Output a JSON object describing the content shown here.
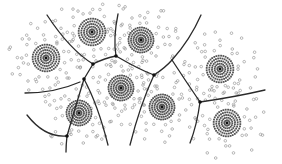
{
  "diagram": {
    "type": "voronoi-cluster-tessellation",
    "width": 282,
    "height": 164,
    "colors": {
      "background": "#ffffff",
      "boundary": "#2a2a2a",
      "junction": "#111111",
      "core_dot": "#555555",
      "scatter_dot": "#9a9a9a",
      "center": "#111111"
    },
    "clusters": [
      {
        "id": "c1",
        "cx": 46,
        "cy": 58,
        "r": 15
      },
      {
        "id": "c2",
        "cx": 92,
        "cy": 32,
        "r": 15
      },
      {
        "id": "c3",
        "cx": 141,
        "cy": 40,
        "r": 14
      },
      {
        "id": "c4",
        "cx": 220,
        "cy": 69,
        "r": 15
      },
      {
        "id": "c5",
        "cx": 121,
        "cy": 88,
        "r": 14
      },
      {
        "id": "c6",
        "cx": 79,
        "cy": 113,
        "r": 14
      },
      {
        "id": "c7",
        "cx": 162,
        "cy": 107,
        "r": 14
      },
      {
        "id": "c8",
        "cx": 227,
        "cy": 123,
        "r": 15
      }
    ],
    "junctions": [
      {
        "x": 93,
        "y": 64
      },
      {
        "x": 116,
        "y": 56
      },
      {
        "x": 84,
        "y": 79
      },
      {
        "x": 154,
        "y": 75
      },
      {
        "x": 200,
        "y": 102
      },
      {
        "x": 67,
        "y": 136
      }
    ],
    "boundaries": [
      "M47,15 Q70,50 93,64",
      "M93,64 Q105,58 116,56",
      "M118,14 Q113,38 116,56",
      "M116,56 Q140,70 154,75",
      "M154,75 Q165,68 172,60",
      "M201,15 Q190,40 172,60",
      "M172,60 Q185,80 200,102",
      "M200,102 Q235,97 265,90",
      "M200,102 Q197,125 190,143",
      "M154,75 Q140,105 130,145",
      "M93,64 L84,79",
      "M84,79 Q98,105 108,145",
      "M84,79 Q75,108 67,136",
      "M67,136 Q45,138 27,115",
      "M67,136 Q66,145 66,152",
      "M80,82 Q55,93 25,93"
    ]
  }
}
